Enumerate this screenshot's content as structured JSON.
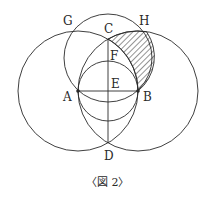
{
  "figure": {
    "caption": "〈図 2〉",
    "points": {
      "A": {
        "label": "A",
        "x": 78,
        "y": 91
      },
      "B": {
        "label": "B",
        "x": 138,
        "y": 91
      },
      "C": {
        "label": "C",
        "x": 108,
        "y": 39
      },
      "D": {
        "label": "D",
        "x": 108,
        "y": 143
      },
      "E": {
        "label": "E",
        "x": 108,
        "y": 91
      },
      "F": {
        "label": "F",
        "x": 108,
        "y": 58
      },
      "G": {
        "label": "G"
      },
      "H": {
        "label": "H"
      }
    },
    "circles": [
      {
        "name": "circle-center-A",
        "cx": 78,
        "cy": 91,
        "r": 60
      },
      {
        "name": "circle-center-B",
        "cx": 138,
        "cy": 91,
        "r": 60
      },
      {
        "name": "circle-center-F",
        "cx": 108,
        "cy": 58,
        "r": 44
      },
      {
        "name": "circle-center-E",
        "cx": 108,
        "cy": 91,
        "r": 30
      }
    ],
    "segments": [
      "AB",
      "CD"
    ],
    "shaded_region": "region bounded by arc CH, arc HB, arc BC",
    "colors": {
      "line": "#2a2a2a",
      "background": "#ffffff"
    }
  }
}
